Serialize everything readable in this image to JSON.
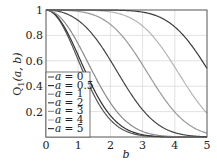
{
  "chart_data": {
    "type": "line",
    "title": "",
    "xlabel": "b",
    "ylabel": "Q1(a, b)",
    "xlim": [
      0,
      5
    ],
    "ylim": [
      0,
      1
    ],
    "xticks": [
      "0",
      "1",
      "2",
      "3",
      "4",
      "5"
    ],
    "yticks": [
      "0.2",
      "0.4",
      "0.6",
      "0.8",
      "1"
    ],
    "grid": true,
    "legend_position": "lower left",
    "series": [
      {
        "name": "a = 0",
        "a": 0,
        "color": "#555555",
        "x": [
          0,
          0.5,
          1,
          1.5,
          2,
          2.5,
          3,
          3.5,
          4,
          4.5,
          5
        ],
        "values": [
          1,
          0.88,
          0.61,
          0.32,
          0.14,
          0.04,
          0.01,
          0,
          0,
          0,
          0
        ]
      },
      {
        "name": "a = 0.5",
        "a": 0.5,
        "color": "#333333",
        "x": [
          0,
          0.5,
          1,
          1.5,
          2,
          2.5,
          3,
          3.5,
          4,
          4.5,
          5
        ],
        "values": [
          1,
          0.89,
          0.65,
          0.37,
          0.16,
          0.06,
          0.02,
          0,
          0,
          0,
          0
        ]
      },
      {
        "name": "a = 1",
        "a": 1,
        "color": "#8a8a8a",
        "x": [
          0,
          0.5,
          1,
          1.5,
          2,
          2.5,
          3,
          3.5,
          4,
          4.5,
          5
        ],
        "values": [
          1,
          0.91,
          0.73,
          0.48,
          0.25,
          0.1,
          0.03,
          0.01,
          0,
          0,
          0
        ]
      },
      {
        "name": "a = 2",
        "a": 2,
        "color": "#444444",
        "x": [
          0,
          0.5,
          1,
          1.5,
          2,
          2.5,
          3,
          3.5,
          4,
          4.5,
          5
        ],
        "values": [
          1,
          0.98,
          0.91,
          0.77,
          0.56,
          0.34,
          0.16,
          0.06,
          0.02,
          0,
          0
        ]
      },
      {
        "name": "a = 3",
        "a": 3,
        "color": "#999999",
        "x": [
          0,
          0.5,
          1,
          1.5,
          2,
          2.5,
          3,
          3.5,
          4,
          4.5,
          5
        ],
        "values": [
          1,
          1,
          0.99,
          0.96,
          0.87,
          0.71,
          0.5,
          0.29,
          0.13,
          0.05,
          0.01
        ]
      },
      {
        "name": "a = 4",
        "a": 4,
        "color": "#b5b5b5",
        "x": [
          0,
          0.5,
          1,
          1.5,
          2,
          2.5,
          3,
          3.5,
          4,
          4.5,
          5
        ],
        "values": [
          1,
          1,
          1,
          1,
          0.98,
          0.94,
          0.84,
          0.67,
          0.46,
          0.27,
          0.12
        ]
      },
      {
        "name": "a = 5",
        "a": 5,
        "color": "#3a3a3a",
        "x": [
          0,
          0.5,
          1,
          1.5,
          2,
          2.5,
          3,
          3.5,
          4,
          4.5,
          5
        ],
        "values": [
          1,
          1,
          1,
          1,
          1,
          1,
          0.98,
          0.93,
          0.81,
          0.65,
          0.46
        ]
      }
    ]
  },
  "legend": {
    "entries": [
      "a = 0",
      "a = 0.5",
      "a = 1",
      "a = 2",
      "a = 3",
      "a = 4",
      "a = 5"
    ]
  },
  "axes": {
    "xlabel": "b",
    "ylabel_main": "Q",
    "ylabel_sub": "1",
    "ylabel_args": "(a, b)"
  }
}
